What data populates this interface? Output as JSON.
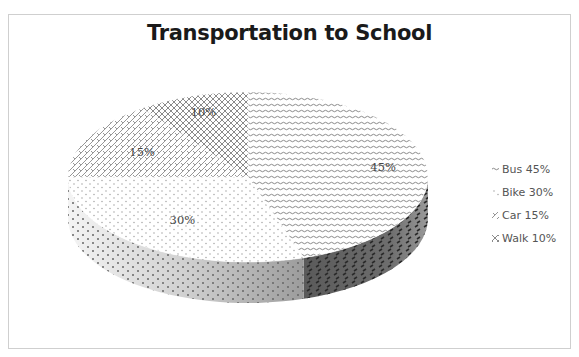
{
  "chart_data": {
    "type": "pie",
    "style": "3d",
    "title": "Transportation to School",
    "categories": [
      "Bus",
      "Bike",
      "Car",
      "Walk"
    ],
    "values": [
      45,
      30,
      15,
      10
    ],
    "unit": "%",
    "data_labels": [
      "45%",
      "30%",
      "15%",
      "10%"
    ],
    "legend": {
      "placement": "right",
      "entries": [
        "Bus 45%",
        "Bike 30%",
        "Car 15%",
        "Walk 10%"
      ]
    },
    "fill_patterns": [
      "wave-horizontal",
      "dots",
      "diagonal-cross",
      "diamond-lattice"
    ],
    "colors": {
      "pattern_ink": "#555555",
      "side_dark": "#6e6e6e",
      "side_light": "#d9d9d9",
      "frame_border": "#cfcfcf"
    }
  }
}
